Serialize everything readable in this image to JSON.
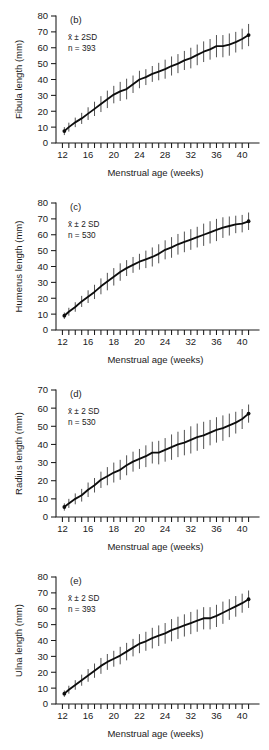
{
  "figure": {
    "panel_count": 4,
    "shared_xlabel": "Menstrual age (weeks)",
    "ylabel_unit": "(mm)"
  },
  "chart_data": [
    {
      "type": "line",
      "panel": "(b)",
      "title": "",
      "xlabel": "Menstrual age (weeks)",
      "ylabel": "Fibula length (mm)",
      "legend": [
        "x̄ ± 2SD",
        "n = 393"
      ],
      "sd_note": "x̄ ± 2SD",
      "sample_size": "n = 393",
      "xlim": [
        11,
        42
      ],
      "ylim": [
        0,
        80
      ],
      "xticks": [
        12,
        13,
        14,
        15,
        16,
        17,
        18,
        19,
        20,
        21,
        22,
        23,
        24,
        25,
        26,
        27,
        28,
        29,
        30,
        31,
        32,
        33,
        34,
        35,
        36,
        37,
        38,
        39,
        40,
        41
      ],
      "xtick_labels": [
        12,
        16,
        20,
        24,
        28,
        32,
        36,
        40
      ],
      "yticks": [
        0,
        10,
        20,
        30,
        40,
        50,
        60,
        70,
        80
      ],
      "grid": false,
      "x": [
        12.3,
        13,
        14,
        15,
        16,
        17,
        18,
        19,
        20,
        21,
        22,
        23,
        24,
        25,
        26,
        27,
        28,
        29,
        30,
        31,
        32,
        33,
        34,
        35,
        36,
        37,
        38,
        39,
        40,
        41
      ],
      "values": [
        7.5,
        10,
        13,
        15.5,
        18.5,
        21.5,
        24.5,
        27.5,
        30.5,
        32.5,
        34,
        37,
        40,
        41.5,
        43.5,
        45,
        46.5,
        48.5,
        50,
        52,
        53.5,
        55.5,
        57.5,
        59,
        61,
        61,
        62,
        63.5,
        65.5,
        68
      ],
      "sd": [
        2.5,
        2.8,
        3,
        3.5,
        4,
        4.5,
        5,
        5.5,
        5.5,
        6,
        6.5,
        5.5,
        5.5,
        5,
        5,
        5.5,
        6,
        6,
        6,
        6,
        6.5,
        6.5,
        6.5,
        6.5,
        7,
        7,
        7,
        6.5,
        6.5,
        7
      ]
    },
    {
      "type": "line",
      "panel": "(c)",
      "title": "",
      "xlabel": "Menstrual age (weeks)",
      "ylabel": "Humerus length (mm)",
      "legend": [
        "x̄ ± 2 SD",
        "n = 530"
      ],
      "sd_note": "x̄ ± 2 SD",
      "sample_size": "n = 530",
      "xlim": [
        11,
        42
      ],
      "ylim": [
        0,
        80
      ],
      "xticks": [
        12,
        13,
        14,
        15,
        16,
        17,
        18,
        19,
        20,
        21,
        22,
        23,
        24,
        25,
        26,
        27,
        28,
        29,
        30,
        31,
        32,
        33,
        34,
        35,
        36,
        37,
        38,
        39,
        40,
        41
      ],
      "xtick_labels": [
        12,
        16,
        18,
        20,
        24,
        32,
        36,
        40
      ],
      "yticks": [
        0,
        10,
        20,
        30,
        40,
        50,
        60,
        70,
        80
      ],
      "grid": false,
      "x": [
        12.3,
        13,
        14,
        15,
        16,
        17,
        18,
        19,
        20,
        21,
        22,
        23,
        24,
        25,
        26,
        27,
        28,
        29,
        30,
        31,
        32,
        33,
        34,
        35,
        36,
        37,
        38,
        39,
        40,
        41
      ],
      "values": [
        9,
        11.5,
        14.5,
        18,
        21,
        24,
        27.5,
        30.5,
        33.5,
        36.5,
        39,
        41,
        43,
        44.5,
        46,
        48,
        50.5,
        52,
        54,
        55.5,
        57,
        58.5,
        60,
        61.5,
        63,
        64.5,
        65.5,
        66.5,
        67,
        68.5
      ],
      "sd": [
        2,
        2.5,
        3,
        3.5,
        4,
        4.5,
        5,
        5.5,
        5.5,
        5.5,
        5,
        5,
        5,
        5.5,
        6,
        6,
        6,
        6.5,
        6.5,
        6.5,
        6.5,
        6.5,
        7,
        7,
        7,
        6.5,
        6,
        5.5,
        5.5,
        5.5
      ]
    },
    {
      "type": "line",
      "panel": "(d)",
      "title": "",
      "xlabel": "Menstrual age (weeks)",
      "ylabel": "Radius length (mm)",
      "legend": [
        "x̄ ± 2 SD",
        "n = 530"
      ],
      "sd_note": "x̄ ± 2 SD",
      "sample_size": "n = 530",
      "xlim": [
        11,
        42
      ],
      "ylim": [
        0,
        70
      ],
      "xticks": [
        12,
        13,
        14,
        15,
        16,
        17,
        18,
        19,
        20,
        21,
        22,
        23,
        24,
        25,
        26,
        27,
        28,
        29,
        30,
        31,
        32,
        33,
        34,
        35,
        36,
        37,
        38,
        39,
        40,
        41
      ],
      "xtick_labels": [
        12,
        16,
        18,
        20,
        24,
        32,
        36,
        40
      ],
      "yticks": [
        0,
        10,
        20,
        30,
        40,
        50,
        60,
        70
      ],
      "grid": false,
      "x": [
        12.3,
        13,
        14,
        15,
        16,
        17,
        18,
        19,
        20,
        21,
        22,
        23,
        24,
        25,
        26,
        27,
        28,
        29,
        30,
        31,
        32,
        33,
        34,
        35,
        36,
        37,
        38,
        39,
        40,
        41
      ],
      "values": [
        5.5,
        7.5,
        10,
        12,
        15,
        17.5,
        20.5,
        22.5,
        24.5,
        26,
        28.5,
        30.5,
        32,
        33.5,
        35.5,
        35.5,
        37,
        38.5,
        40,
        41,
        42.5,
        44,
        45,
        46.5,
        48,
        49,
        50.5,
        52,
        54,
        57
      ],
      "sd": [
        2,
        2.5,
        3,
        3.5,
        4,
        4,
        4.5,
        5,
        5.5,
        5.5,
        5.5,
        5.5,
        5.5,
        6,
        6,
        6.5,
        6.5,
        7,
        7,
        7,
        7.5,
        7.5,
        7.5,
        7,
        7,
        7,
        6.5,
        6,
        5.5,
        5
      ]
    },
    {
      "type": "line",
      "panel": "(e)",
      "title": "",
      "xlabel": "Menstrual age (weeks)",
      "ylabel": "Ulna length (mm)",
      "legend": [
        "x̄ ± 2 SD",
        "n = 393"
      ],
      "sd_note": "x̄ ± 2 SD",
      "sample_size": "n = 393",
      "xlim": [
        11,
        42
      ],
      "ylim": [
        0,
        80
      ],
      "xticks": [
        12,
        13,
        14,
        15,
        16,
        17,
        18,
        19,
        20,
        21,
        22,
        23,
        24,
        25,
        26,
        27,
        28,
        29,
        30,
        31,
        32,
        33,
        34,
        35,
        36,
        37,
        38,
        39,
        40,
        41
      ],
      "xtick_labels": [
        12,
        16,
        20,
        22,
        24,
        32,
        36,
        40
      ],
      "yticks": [
        0,
        10,
        20,
        30,
        40,
        50,
        60,
        70,
        80
      ],
      "grid": false,
      "x": [
        12.3,
        13,
        14,
        15,
        16,
        17,
        18,
        19,
        20,
        21,
        22,
        23,
        24,
        25,
        26,
        27,
        28,
        29,
        30,
        31,
        32,
        33,
        34,
        35,
        36,
        37,
        38,
        39,
        40,
        41
      ],
      "values": [
        6.5,
        9,
        12,
        15,
        18,
        21,
        24,
        26.5,
        28.5,
        30.5,
        33,
        35.5,
        38,
        39.5,
        41.5,
        43,
        44.5,
        46.5,
        48,
        49.5,
        51,
        52.5,
        54,
        54,
        55.5,
        57.5,
        59.5,
        61.5,
        63.5,
        66
      ],
      "sd": [
        2,
        2.5,
        3,
        3.5,
        4,
        4.5,
        5,
        5,
        5,
        5.5,
        5.5,
        5.5,
        6,
        6,
        6.5,
        6.5,
        6.5,
        7,
        7,
        7,
        7,
        7,
        7,
        7,
        7,
        7,
        6.5,
        6.5,
        6,
        5.5
      ]
    }
  ]
}
